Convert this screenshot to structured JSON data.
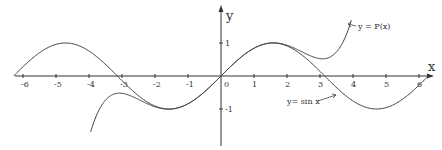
{
  "chart_data": {
    "type": "line",
    "title": "",
    "xlabel": "x",
    "ylabel": "y",
    "xlim": [
      -6.3,
      6.5
    ],
    "ylim": [
      -2.1,
      2.3
    ],
    "grid": false,
    "x_ticks": [
      -6,
      -5,
      -4,
      -3,
      -2,
      -1,
      0,
      1,
      2,
      3,
      4,
      5,
      6
    ],
    "x_tick_labels": [
      "-6",
      "-5",
      "-4",
      "-3",
      "-2",
      "-1",
      "0",
      "1",
      "2",
      "3",
      "4",
      "5",
      "6"
    ],
    "y_ticks": [
      1,
      -1
    ],
    "y_tick_labels": [
      "1",
      "-1"
    ],
    "series": [
      {
        "name": "y = sin x",
        "function": "sin(x)",
        "x_range": [
          -6.283,
          6.283
        ],
        "annotation": "y= sin x"
      },
      {
        "name": "y = P(x)",
        "function": "x - x^3/6 + x^5/120",
        "x_range": [
          -3.95,
          3.95
        ],
        "annotation": "y = P(x)"
      }
    ]
  }
}
